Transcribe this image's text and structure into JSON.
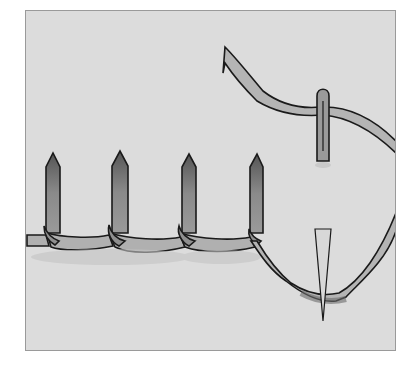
{
  "illustration": {
    "subject": "stitch-diagram",
    "description": "Hand-drawn grayscale illustration of a looped stitch with four upright stitches along a baseline and a needle with thread",
    "colors": {
      "background": "#ffffff",
      "paper": "#dcdcdc",
      "frame_border": "#9a9a9a",
      "thread_fill": "#b4b4b4",
      "thread_shade": "#7a7a7a",
      "outline": "#1a1a1a"
    },
    "upright_stitch_count": 4
  }
}
